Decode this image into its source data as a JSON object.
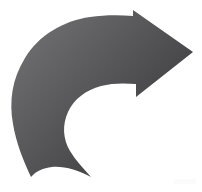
{
  "canvas": {
    "width": 202,
    "height": 192,
    "background_color": "#ffffff",
    "title": "Curved Arrow Graphic"
  },
  "graphic": {
    "name": "curved-arrow",
    "description": "Thick curved arrow sweeping counterclockwise from a tapered tail at lower-left, arcing up and over to the right, ending in a solid triangular arrowhead pointing right",
    "direction": "clockwise-to-right",
    "fill_style": "linear-gradient",
    "colors": {
      "gradient_light": "#6e6e70",
      "gradient_mid": "#58585a",
      "gradient_dark": "#3a3a3c",
      "outline": "none",
      "background": "#ffffff"
    },
    "gradient": {
      "x1": "12%",
      "y1": "10%",
      "x2": "92%",
      "y2": "78%",
      "stops": [
        {
          "offset": "0%",
          "color": "#6e6e70"
        },
        {
          "offset": "45%",
          "color": "#575759"
        },
        {
          "offset": "100%",
          "color": "#3a3a3c"
        }
      ]
    },
    "path": "M 31 177 C 23 160 16 142 13 124 C 9 101 12 79 25 58 C 39 35 63 21 90 17 C 104 15 119 15 133 16 L 133 10 L 193 52 L 136 97 L 136 84 C 124 83 112 83 101 86 C 86 90 74 99 68 112 C 62 125 63 139 70 151 C 76 161 84 169 91 177 C 78 170 64 166 52 167 C 43 168 36 171 31 177 Z",
    "key_points": {
      "tail_tip": [
        31,
        177
      ],
      "outer_left_extent": [
        13,
        124
      ],
      "outer_top_apex": [
        120,
        22
      ],
      "barb_upper": [
        133,
        10
      ],
      "arrow_tip": [
        193,
        52
      ],
      "barb_lower": [
        136,
        97
      ],
      "inner_hook": [
        68,
        112
      ]
    }
  },
  "watermark": {
    "name": "faint-corner-mark",
    "visible": true,
    "color": "#fbfbfc",
    "position": "bottom-right"
  }
}
